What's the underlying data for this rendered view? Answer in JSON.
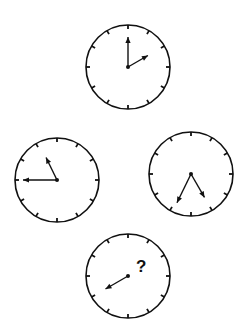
{
  "puzzle": {
    "question_mark": "?",
    "stroke_color": "#111111",
    "face_color": "#ffffff",
    "clocks": [
      {
        "id": "top",
        "cx": 128,
        "cy": 67,
        "r": 42,
        "hands": [
          {
            "angle": 0,
            "len": 30
          },
          {
            "angle": 60,
            "len": 23
          }
        ]
      },
      {
        "id": "left",
        "cx": 57,
        "cy": 180,
        "r": 42,
        "hands": [
          {
            "angle": 270,
            "len": 34
          },
          {
            "angle": 334,
            "len": 25
          }
        ]
      },
      {
        "id": "right",
        "cx": 191,
        "cy": 174,
        "r": 42,
        "hands": [
          {
            "angle": 150,
            "len": 27
          },
          {
            "angle": 206,
            "len": 32
          }
        ]
      },
      {
        "id": "bottom",
        "cx": 128,
        "cy": 276,
        "r": 42,
        "hands": [
          {
            "angle": 240,
            "len": 26
          }
        ],
        "has_question": true
      }
    ]
  }
}
